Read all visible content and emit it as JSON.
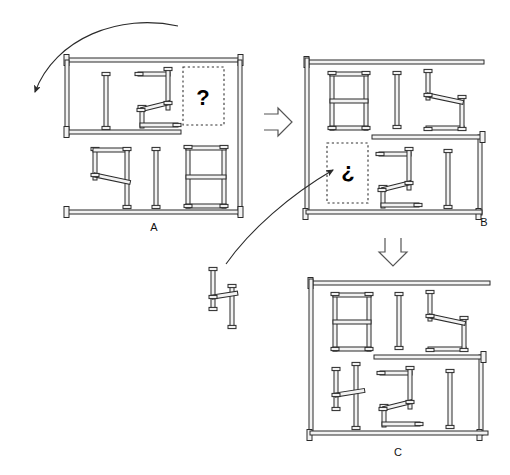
{
  "figure": {
    "type": "sequence-diagram",
    "background_color": "#ffffff",
    "stroke_color": "#2b2b2b",
    "fill_color": "#f2f2f2"
  },
  "panels": [
    {
      "id": "A",
      "label": "A",
      "placeholder": {
        "symbol": "?",
        "name": "question-mark",
        "style": "dotted-box"
      }
    },
    {
      "id": "B",
      "label": "B",
      "placeholder": {
        "symbol": "¿",
        "name": "inverted-question-mark",
        "style": "dotted-box"
      }
    },
    {
      "id": "C",
      "label": "C",
      "placeholder": null
    }
  ],
  "arrows": [
    {
      "name": "rotation-arrow-left",
      "kind": "curved-thin",
      "from": "panel-a-top",
      "to": "left-margin",
      "direction": "counterclockwise-down"
    },
    {
      "name": "step-arrow-a-to-b",
      "kind": "hollow-block",
      "direction": "right"
    },
    {
      "name": "step-arrow-b-to-c",
      "kind": "hollow-block",
      "direction": "down"
    },
    {
      "name": "insert-arrow-piece-to-b",
      "kind": "curved-thin",
      "from": "loose-piece",
      "to": "panel-b-placeholder",
      "direction": "up-right"
    }
  ],
  "loose_piece": {
    "name": "loose-piece-h-shape",
    "description": "detached H-shaped rod assembly positioned between panels"
  }
}
